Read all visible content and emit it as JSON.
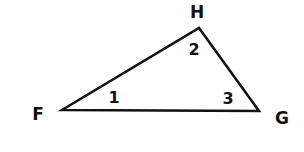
{
  "diagram": {
    "type": "triangle",
    "stroke_color": "#111111",
    "background": "#ffffff",
    "vertices": [
      {
        "name": "F",
        "x": 62,
        "y": 110,
        "label_x": 38,
        "label_y": 120
      },
      {
        "name": "G",
        "x": 259,
        "y": 111,
        "label_x": 282,
        "label_y": 124
      },
      {
        "name": "H",
        "x": 199,
        "y": 28,
        "label_x": 197,
        "label_y": 18
      }
    ],
    "angles": [
      {
        "label": "1",
        "vertex": "F",
        "x": 114,
        "y": 103
      },
      {
        "label": "2",
        "vertex": "H",
        "x": 194,
        "y": 55
      },
      {
        "label": "3",
        "vertex": "G",
        "x": 228,
        "y": 104
      }
    ]
  }
}
